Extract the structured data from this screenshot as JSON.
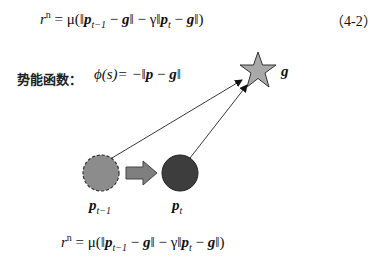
{
  "equation_top": {
    "lhs": "r",
    "sup": "n",
    "eq": " = μ(‖",
    "p1": "p",
    "sub1": "t−1",
    "mid1": " − ",
    "g1": "g",
    "mid2": "‖ − γ‖",
    "p2": "p",
    "sub2": "t",
    "mid3": " − ",
    "g2": "g",
    "end": "‖)",
    "number": "（4-2）"
  },
  "potential": {
    "label": "势能函数：",
    "phi": "ϕ(s)= −‖",
    "p": "p",
    "minus": " − ",
    "g": "g",
    "end": "‖"
  },
  "diagram": {
    "goal_label": "g",
    "prev_label_p": "p",
    "prev_label_sub": "t−1",
    "curr_label_p": "p",
    "curr_label_sub": "t",
    "colors": {
      "star_fill": "#a9a9a9",
      "prev_fill": "#8c8c8c",
      "curr_fill": "#3d3d3d",
      "arrow_fill": "#7f7f7f",
      "stroke": "#333333"
    }
  },
  "equation_bottom": {
    "lhs": "r",
    "sup": "n",
    "eq": " = μ(‖",
    "p1": "p",
    "sub1": "t−1",
    "mid1": " − ",
    "g1": "g",
    "mid2": "‖ − γ‖",
    "p2": "p",
    "sub2": "t",
    "mid3": " − ",
    "g2": "g",
    "end": "‖)"
  }
}
